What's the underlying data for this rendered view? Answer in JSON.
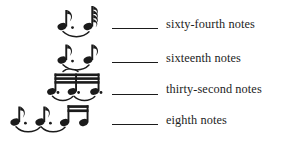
{
  "figure": {
    "type": "music-notation-reference-chart",
    "background_color": "#ffffff",
    "ink_color": "#1b1b1b",
    "rows": [
      {
        "label": "sixty-fourth notes",
        "rule": "horizontal-rule",
        "notation_description": "dotted eighth note tied by a slur to a sixty-fourth note",
        "note_count": 2,
        "flags": [
          1,
          4
        ],
        "dots": [
          1,
          0
        ],
        "beamed": false,
        "slur": true
      },
      {
        "label": "sixteenth notes",
        "rule": "horizontal-rule",
        "notation_description": "dotted eighth note tied by a slur to an eighth note",
        "note_count": 2,
        "flags": [
          1,
          1
        ],
        "dots": [
          1,
          0
        ],
        "beamed": false,
        "slur": true
      },
      {
        "label": "thirty-second notes",
        "rule": "horizontal-rule",
        "notation_description": "two beamed pairs of dotted thirty-second notes joined by slurs",
        "note_count": 4,
        "flags": [
          0,
          0,
          0,
          0
        ],
        "dots": [
          1,
          1,
          1,
          1
        ],
        "beamed": true,
        "beam_count": 3,
        "slur": true
      },
      {
        "label": "eighth notes",
        "rule": "horizontal-rule",
        "notation_description": "two dotted quarter-like notes with slurs followed by a beamed pair of sixteenth notes",
        "note_count": 4,
        "flags": [
          1,
          1,
          0,
          0
        ],
        "dots": [
          1,
          1,
          0,
          0
        ],
        "beamed": true,
        "beam_count": 2,
        "slur": true
      }
    ]
  }
}
